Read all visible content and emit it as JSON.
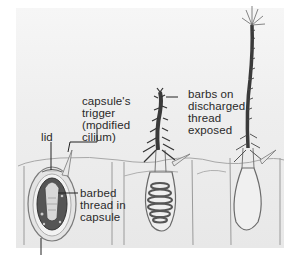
{
  "figure": {
    "colors": {
      "panel_background": "#ececec",
      "outline": "#6e6e6e",
      "thread_dark": "#3a3a3a",
      "capsule_fill": "#5a5a5a",
      "label_text": "#2a2a2a"
    }
  },
  "labels": {
    "trigger": "capsule's\ntrigger\n(modified\ncilium)",
    "lid": "lid",
    "barbed_thread": "barbed\nthread in\ncapsule",
    "barbs": "barbs on\ndischarged\nthread\nexposed"
  },
  "stages": [
    {
      "name": "undischarged",
      "description": "capsule with coiled barbed thread, lid closed, trigger present"
    },
    {
      "name": "discharging",
      "description": "thread everting, coils remaining in capsule, barbs exposed"
    },
    {
      "name": "discharged",
      "description": "fully extended thread with spines at tip, empty capsule"
    }
  ]
}
